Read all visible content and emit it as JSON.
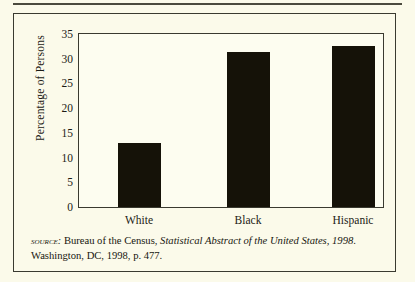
{
  "figure": {
    "background_color": "#fbfaea",
    "bar_color": "#151208",
    "frame_color": "#3a3a30"
  },
  "chart_data": {
    "type": "bar",
    "title": "",
    "xlabel": "",
    "ylabel": "Percentage of Persons",
    "categories": [
      "White",
      "Black",
      "Hispanic"
    ],
    "values": [
      13,
      31.4,
      32.6
    ],
    "ylim": [
      0,
      35
    ],
    "yticks": [
      0,
      5,
      10,
      15,
      20,
      25,
      30,
      35
    ],
    "ytick_labels": [
      "0",
      "5",
      "10",
      "15",
      "20",
      "25",
      "30",
      "35"
    ],
    "grid": false,
    "legend": "none",
    "series": [
      {
        "name": "Percentage of Persons",
        "values": [
          13,
          31.4,
          32.6
        ]
      }
    ]
  },
  "source": {
    "label": "source:",
    "text_before_italic": " Bureau of the Census, ",
    "italic_title": "Statistical Abstract of the United States, 1998",
    "text_after_italic": ". Washington, DC, 1998, p. 477."
  }
}
